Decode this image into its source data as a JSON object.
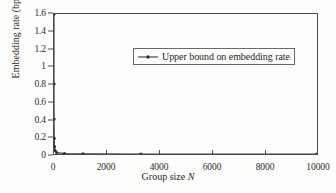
{
  "chart_data": {
    "type": "line",
    "title": "",
    "xlabel": "Group size N",
    "xlabel_plain": "Group size ",
    "xlabel_italic": "N",
    "ylabel": "Embedding rate (bpp)",
    "xlim": [
      0,
      10000
    ],
    "ylim": [
      0,
      1.6
    ],
    "grid": false,
    "legend_position": "upper-center",
    "xticks": [
      0,
      2000,
      4000,
      6000,
      8000,
      10000
    ],
    "xticklabels": [
      "0",
      "2000",
      "4000",
      "6000",
      "8000",
      "10000"
    ],
    "yticks": [
      0,
      0.2,
      0.4,
      0.6,
      0.8,
      1,
      1.2,
      1.4,
      1.6
    ],
    "yticklabels": [
      "0",
      "0.2",
      "0.4",
      "0.6",
      "0.8",
      "1",
      "1.2",
      "1.4",
      "1.6"
    ],
    "marker": "dot",
    "line_color": "#3a3a3a",
    "series": [
      {
        "name": "Upper bound on embedding rate",
        "x": [
          1,
          2,
          4,
          9,
          19,
          40,
          100,
          400,
          1100,
          3300,
          10000
        ],
        "y": [
          1.6,
          0.8,
          0.4,
          0.178,
          0.084,
          0.04,
          0.016,
          0.004,
          0.00145,
          0.00048,
          0.00016
        ]
      }
    ]
  },
  "legend": {
    "entries": [
      {
        "label": "Upper bound on embedding rate",
        "marker": "line-dot",
        "color": "#3a3a3a"
      }
    ]
  },
  "colors": {
    "axis": "#4a4a4a",
    "text": "#1f1f1f",
    "line": "#3a3a3a",
    "background": "#fdfdfc"
  }
}
